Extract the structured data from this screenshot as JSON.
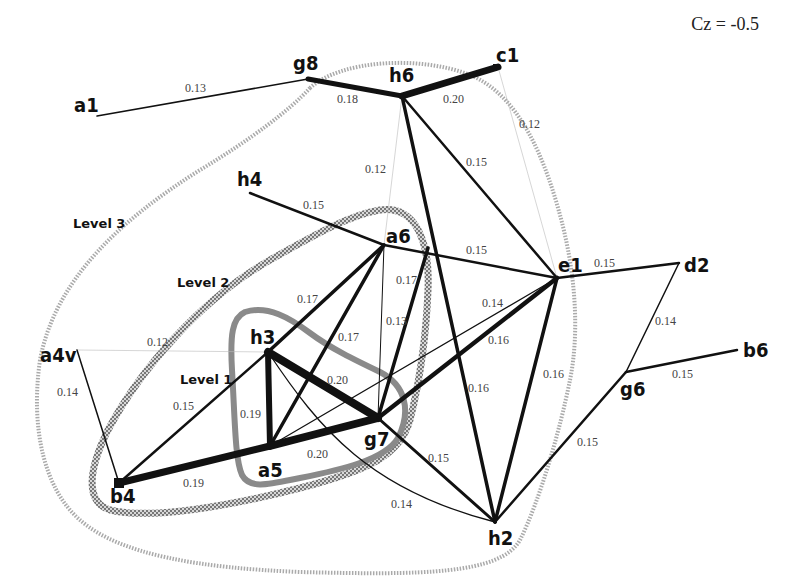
{
  "annotation": {
    "cz_label": "Cz = -0.5"
  },
  "levels": [
    {
      "id": "level1",
      "label": "Level 1",
      "style": "solid-gray"
    },
    {
      "id": "level2",
      "label": "Level 2",
      "style": "checkered-gray"
    },
    {
      "id": "level3",
      "label": "Level 3",
      "style": "dotted-light"
    }
  ],
  "nodes": [
    {
      "id": "a1",
      "label": "a1",
      "x": 97,
      "y": 116,
      "lx": 74,
      "ly": 112
    },
    {
      "id": "g8",
      "label": "g8",
      "x": 308,
      "y": 79,
      "lx": 293,
      "ly": 70
    },
    {
      "id": "h6",
      "label": "h6",
      "x": 402,
      "y": 96,
      "lx": 389,
      "ly": 82
    },
    {
      "id": "c1",
      "label": "c1",
      "x": 498,
      "y": 67,
      "lx": 496,
      "ly": 62
    },
    {
      "id": "h4",
      "label": "h4",
      "x": 250,
      "y": 193,
      "lx": 237,
      "ly": 186
    },
    {
      "id": "a6",
      "label": "a6",
      "x": 384,
      "y": 245,
      "lx": 386,
      "ly": 243
    },
    {
      "id": "e1",
      "label": "e1",
      "x": 557,
      "y": 278,
      "lx": 558,
      "ly": 272
    },
    {
      "id": "d2",
      "label": "d2",
      "x": 679,
      "y": 263,
      "lx": 684,
      "ly": 272
    },
    {
      "id": "a4v",
      "label": "a4v",
      "x": 77,
      "y": 350,
      "lx": 40,
      "ly": 362
    },
    {
      "id": "h3",
      "label": "h3",
      "x": 268,
      "y": 352,
      "lx": 250,
      "ly": 344
    },
    {
      "id": "b6",
      "label": "b6",
      "x": 737,
      "y": 350,
      "lx": 743,
      "ly": 357
    },
    {
      "id": "g6",
      "label": "g6",
      "x": 626,
      "y": 372,
      "lx": 620,
      "ly": 396
    },
    {
      "id": "a5",
      "label": "a5",
      "x": 270,
      "y": 446,
      "lx": 258,
      "ly": 477
    },
    {
      "id": "g7",
      "label": "g7",
      "x": 378,
      "y": 418,
      "lx": 364,
      "ly": 446
    },
    {
      "id": "b4",
      "label": "b4",
      "x": 119,
      "y": 483,
      "lx": 110,
      "ly": 503
    },
    {
      "id": "h2",
      "label": "h2",
      "x": 495,
      "y": 522,
      "lx": 488,
      "ly": 545
    }
  ],
  "edges": [
    {
      "from": "a1",
      "to": "g8",
      "weight": "0.13",
      "wx": 185,
      "wy": 92
    },
    {
      "from": "g8",
      "to": "h6",
      "weight": "0.18",
      "wx": 337,
      "wy": 103
    },
    {
      "from": "h6",
      "to": "c1",
      "weight": "0.20",
      "wx": 443,
      "wy": 103
    },
    {
      "from": "c1",
      "to": "e1",
      "weight": "0.12",
      "wx": 519,
      "wy": 128
    },
    {
      "from": "h6",
      "to": "a6",
      "weight": "0.12",
      "wx": 365,
      "wy": 173
    },
    {
      "from": "h6",
      "to": "e1",
      "weight": "0.15",
      "wx": 466,
      "wy": 166
    },
    {
      "from": "h6",
      "to": "h2",
      "weight": "0.16",
      "wx": 468,
      "wy": 392
    },
    {
      "from": "h4",
      "to": "a6",
      "weight": "0.15",
      "wx": 303,
      "wy": 209
    },
    {
      "from": "a6",
      "to": "e1",
      "weight": "0.15",
      "wx": 466,
      "wy": 254
    },
    {
      "from": "e1",
      "to": "d2",
      "weight": "0.15",
      "wx": 594,
      "wy": 267
    },
    {
      "from": "d2",
      "to": "g6",
      "weight": "0.14",
      "wx": 655,
      "wy": 325
    },
    {
      "from": "g6",
      "to": "b6",
      "weight": "0.15",
      "wx": 672,
      "wy": 378
    },
    {
      "from": "g6",
      "to": "h2",
      "weight": "0.15",
      "wx": 577,
      "wy": 446
    },
    {
      "from": "e1",
      "to": "h2",
      "weight": "0.16",
      "wx": 543,
      "wy": 378
    },
    {
      "from": "a6",
      "to": "h3",
      "weight": "0.17",
      "wx": 297,
      "wy": 303
    },
    {
      "from": "a6",
      "to": "a5",
      "weight": "0.17",
      "wx": 338,
      "wy": 341
    },
    {
      "from": "a6",
      "to": "g7",
      "weight": "0.13",
      "wx": 386,
      "wy": 325
    },
    {
      "from": "h6",
      "to": "g7",
      "weight": "0.17",
      "wx": 396,
      "wy": 284
    },
    {
      "from": "a5",
      "to": "e1",
      "weight": "0.14",
      "wx": 482,
      "wy": 307
    },
    {
      "from": "g7",
      "to": "e1",
      "weight": "0.16",
      "wx": 488,
      "wy": 344
    },
    {
      "from": "a4v",
      "to": "h3",
      "weight": "0.12",
      "wx": 147,
      "wy": 346
    },
    {
      "from": "a4v",
      "to": "b4",
      "weight": "0.14",
      "wx": 57,
      "wy": 396
    },
    {
      "from": "b4",
      "to": "h3",
      "weight": "0.15",
      "wx": 173,
      "wy": 410
    },
    {
      "from": "b4",
      "to": "a5",
      "weight": "0.19",
      "wx": 183,
      "wy": 487
    },
    {
      "from": "h3",
      "to": "a5",
      "weight": "0.19",
      "wx": 240,
      "wy": 418
    },
    {
      "from": "h3",
      "to": "g7",
      "weight": "0.20",
      "wx": 327,
      "wy": 384
    },
    {
      "from": "a5",
      "to": "g7",
      "weight": "0.20",
      "wx": 307,
      "wy": 458
    },
    {
      "from": "g7",
      "to": "h2",
      "weight": "0.15",
      "wx": 428,
      "wy": 462
    },
    {
      "from": "h3",
      "to": "h2",
      "weight": "0.14",
      "wx": 391,
      "wy": 508
    }
  ]
}
